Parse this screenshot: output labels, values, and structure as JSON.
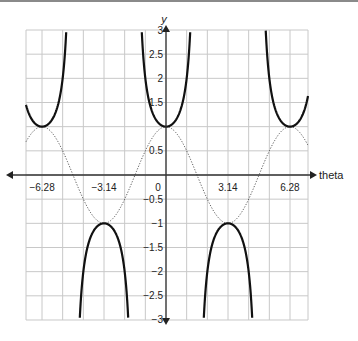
{
  "chart_data": {
    "type": "line",
    "title": "",
    "xlabel": "theta",
    "ylabel": "y",
    "xlim": [
      -8.38,
      8.38
    ],
    "ylim": [
      -3,
      3
    ],
    "grid": true,
    "x_ticks": [
      {
        "value": -6.28,
        "label": "−6.28"
      },
      {
        "value": -3.14,
        "label": "−3.14"
      },
      {
        "value": 0,
        "label": "0"
      },
      {
        "value": 3.14,
        "label": "3.14"
      },
      {
        "value": 6.28,
        "label": "6.28"
      }
    ],
    "y_ticks": [
      {
        "value": 3,
        "label": "3"
      },
      {
        "value": 2.5,
        "label": "2.5"
      },
      {
        "value": 2,
        "label": "2"
      },
      {
        "value": 1.5,
        "label": "1.5"
      },
      {
        "value": 0.5,
        "label": "0.5"
      },
      {
        "value": -0.5,
        "label": "−0.5"
      },
      {
        "value": -1,
        "label": "−1"
      },
      {
        "value": -1.5,
        "label": "−1.5"
      },
      {
        "value": -2,
        "label": "−2"
      },
      {
        "value": -2.5,
        "label": "−2.5"
      },
      {
        "value": -3,
        "label": "−3"
      }
    ],
    "series": [
      {
        "name": "y = sec(theta)",
        "style": "solid-bold",
        "color": "#111111",
        "description": "U-shaped branches with minima at (−6.28, 1), (0, 1), (6.28, 1); inverted branches with maxima at (−3.14, −1), (3.14, −1); vertical asymptotes at ±1.57, ±4.71"
      },
      {
        "name": "y = cos(theta)",
        "style": "dotted",
        "color": "#555555",
        "description": "cosine wave, peaks at (−6.28, 1), (0, 1), (6.28, 1); troughs at (−3.14, −1), (3.14, −1)"
      }
    ],
    "key_points": [
      {
        "x": -6.28,
        "y": 1
      },
      {
        "x": 0,
        "y": 1
      },
      {
        "x": 6.28,
        "y": 1
      },
      {
        "x": -3.14,
        "y": -1
      },
      {
        "x": 3.14,
        "y": -1
      }
    ]
  },
  "labels": {
    "x_axis": "theta",
    "y_axis": "y"
  }
}
